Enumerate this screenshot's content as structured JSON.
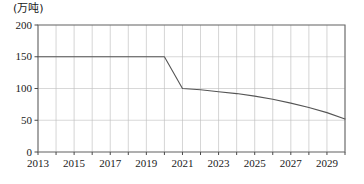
{
  "chart_data": {
    "type": "line",
    "title": "",
    "subtitle": "",
    "xlabel": "",
    "ylabel": "",
    "unit_label": "(万吨)",
    "xlim": [
      2013,
      2030
    ],
    "ylim": [
      0,
      200
    ],
    "grid": true,
    "legend": null,
    "y_ticks": [
      0,
      50,
      100,
      150,
      200
    ],
    "y_tick_labels": [
      "0",
      "50",
      "100",
      "150",
      "200"
    ],
    "x_ticks": [
      2013,
      2015,
      2017,
      2019,
      2021,
      2023,
      2025,
      2027,
      2029
    ],
    "x_tick_labels": [
      "2013",
      "2015",
      "2017",
      "2019",
      "2021",
      "2023",
      "2025",
      "2027",
      "2029"
    ],
    "x_minor_ticks": [
      2014,
      2016,
      2018,
      2020,
      2022,
      2024,
      2026,
      2028,
      2030
    ],
    "series": [
      {
        "name": "产量",
        "color": "#555555",
        "x": [
          2013,
          2014,
          2015,
          2016,
          2017,
          2018,
          2019,
          2020,
          2021,
          2022,
          2023,
          2024,
          2025,
          2026,
          2027,
          2028,
          2029,
          2030
        ],
        "values": [
          150,
          150,
          150,
          150,
          150,
          150,
          150,
          150,
          100,
          98,
          95,
          92,
          88,
          83,
          77,
          70,
          62,
          52
        ]
      }
    ],
    "annotations": []
  },
  "axes": {
    "y_unit_caption": "(万吨)"
  }
}
